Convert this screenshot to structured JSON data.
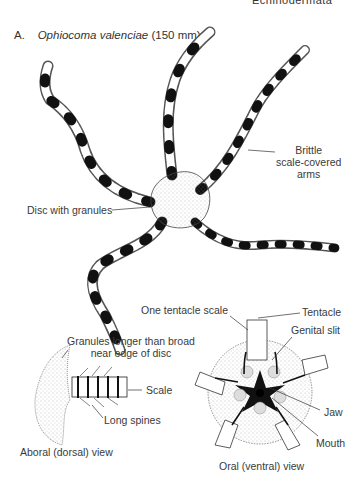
{
  "figure": {
    "top_cut_text": "Echinodermata",
    "panel_letter": "A.",
    "species": "Ophiocoma valenciae",
    "size": "(150 mm)",
    "labels": {
      "arms": [
        "Brittle",
        "scale-covered",
        "arms"
      ],
      "disc": "Disc with granules",
      "granules": [
        "Granules longer than broad",
        "near edge of disc"
      ],
      "scale": "Scale",
      "long_spines": "Long spines",
      "aboral_view": "Aboral (dorsal) view",
      "tentacle_scale": "One tentacle scale",
      "tentacle": "Tentacle",
      "genital_slit": "Genital slit",
      "jaw": "Jaw",
      "mouth": "Mouth",
      "oral_view": "Oral (ventral) view"
    },
    "colors": {
      "ink": "#1a1a1a",
      "text": "#3a3a3a",
      "background": "#ffffff"
    }
  }
}
